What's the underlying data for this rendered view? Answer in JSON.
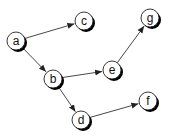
{
  "diagram": {
    "type": "directed-graph",
    "width": 172,
    "height": 138,
    "colors": {
      "background": "#ffffff",
      "node_fill": "#ffffff",
      "node_stroke": "#222222",
      "node_shadow": "#000000",
      "edge": "#333333",
      "label": "#111111"
    },
    "node_radius": 9,
    "nodes": [
      {
        "id": "a",
        "label": "a",
        "x": 16,
        "y": 41
      },
      {
        "id": "c",
        "label": "c",
        "x": 84,
        "y": 21
      },
      {
        "id": "g",
        "label": "g",
        "x": 150,
        "y": 18
      },
      {
        "id": "b",
        "label": "b",
        "x": 53,
        "y": 79
      },
      {
        "id": "e",
        "label": "e",
        "x": 112,
        "y": 70
      },
      {
        "id": "d",
        "label": "d",
        "x": 81,
        "y": 120
      },
      {
        "id": "f",
        "label": "f",
        "x": 148,
        "y": 101
      }
    ],
    "edges": [
      {
        "from": "a",
        "to": "c"
      },
      {
        "from": "a",
        "to": "b"
      },
      {
        "from": "b",
        "to": "e"
      },
      {
        "from": "e",
        "to": "g"
      },
      {
        "from": "b",
        "to": "d"
      },
      {
        "from": "d",
        "to": "f"
      }
    ]
  }
}
